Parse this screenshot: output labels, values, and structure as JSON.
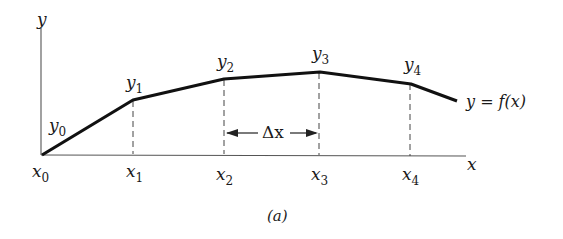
{
  "figure": {
    "caption": "(a)",
    "axes": {
      "x_label": "x",
      "y_label": "y"
    },
    "curve_label": "y = f(x)",
    "delta_label": "Δx",
    "points": [
      {
        "x_label": "x",
        "x_sub": "0",
        "y_label": "y",
        "y_sub": "0"
      },
      {
        "x_label": "x",
        "x_sub": "1",
        "y_label": "y",
        "y_sub": "1"
      },
      {
        "x_label": "x",
        "x_sub": "2",
        "y_label": "y",
        "y_sub": "2"
      },
      {
        "x_label": "x",
        "x_sub": "3",
        "y_label": "y",
        "y_sub": "3"
      },
      {
        "x_label": "x",
        "x_sub": "4",
        "y_label": "y",
        "y_sub": "4"
      }
    ],
    "colors": {
      "line": "#111111",
      "axis": "#444444",
      "text": "#1a1a1a"
    }
  }
}
